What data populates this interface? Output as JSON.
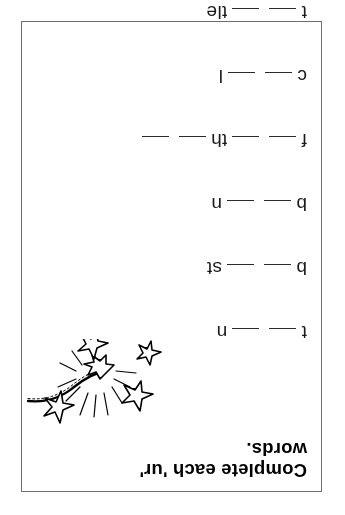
{
  "worksheet": {
    "title_lines": [
      "Complete each 'ur'",
      "words."
    ],
    "orientation": "upside-down",
    "border_color": "#6e6e6e",
    "text_color": "#000000",
    "background_color": "#ffffff"
  },
  "illustration": {
    "name": "sparkler-firework",
    "description": "sparkler with rope fuse and star sparks"
  },
  "exercises": [
    {
      "index": 1,
      "answer_word": "turn",
      "prefix": "t",
      "infix": "",
      "suffix": "n",
      "blank_count": 2,
      "segments": [
        {
          "type": "letters",
          "text": "t"
        },
        {
          "type": "blank"
        },
        {
          "type": "blank"
        },
        {
          "type": "letters",
          "text": "n"
        }
      ]
    },
    {
      "index": 2,
      "answer_word": "burst",
      "prefix": "b",
      "infix": "",
      "suffix": "st",
      "blank_count": 2,
      "segments": [
        {
          "type": "letters",
          "text": "b"
        },
        {
          "type": "blank"
        },
        {
          "type": "blank"
        },
        {
          "type": "letters",
          "text": "st"
        }
      ]
    },
    {
      "index": 3,
      "answer_word": "burn",
      "prefix": "b",
      "infix": "",
      "suffix": "n",
      "blank_count": 2,
      "segments": [
        {
          "type": "letters",
          "text": "b"
        },
        {
          "type": "blank"
        },
        {
          "type": "blank"
        },
        {
          "type": "letters",
          "text": "n"
        }
      ]
    },
    {
      "index": 4,
      "answer_word": "further",
      "prefix": "f",
      "infix": "th",
      "suffix": "",
      "blank_count": 4,
      "segments": [
        {
          "type": "letters",
          "text": "f"
        },
        {
          "type": "blank"
        },
        {
          "type": "blank"
        },
        {
          "type": "letters",
          "text": "th"
        },
        {
          "type": "blank"
        },
        {
          "type": "blank"
        }
      ]
    },
    {
      "index": 5,
      "answer_word": "curl",
      "prefix": "c",
      "infix": "",
      "suffix": "l",
      "blank_count": 2,
      "segments": [
        {
          "type": "letters",
          "text": "c"
        },
        {
          "type": "blank"
        },
        {
          "type": "blank"
        },
        {
          "type": "letters",
          "text": "l"
        }
      ]
    },
    {
      "index": 6,
      "answer_word": "turtle",
      "prefix": "t",
      "infix": "",
      "suffix": "tle",
      "blank_count": 2,
      "segments": [
        {
          "type": "letters",
          "text": "t"
        },
        {
          "type": "blank"
        },
        {
          "type": "blank"
        },
        {
          "type": "letters",
          "text": "tle"
        }
      ]
    }
  ]
}
